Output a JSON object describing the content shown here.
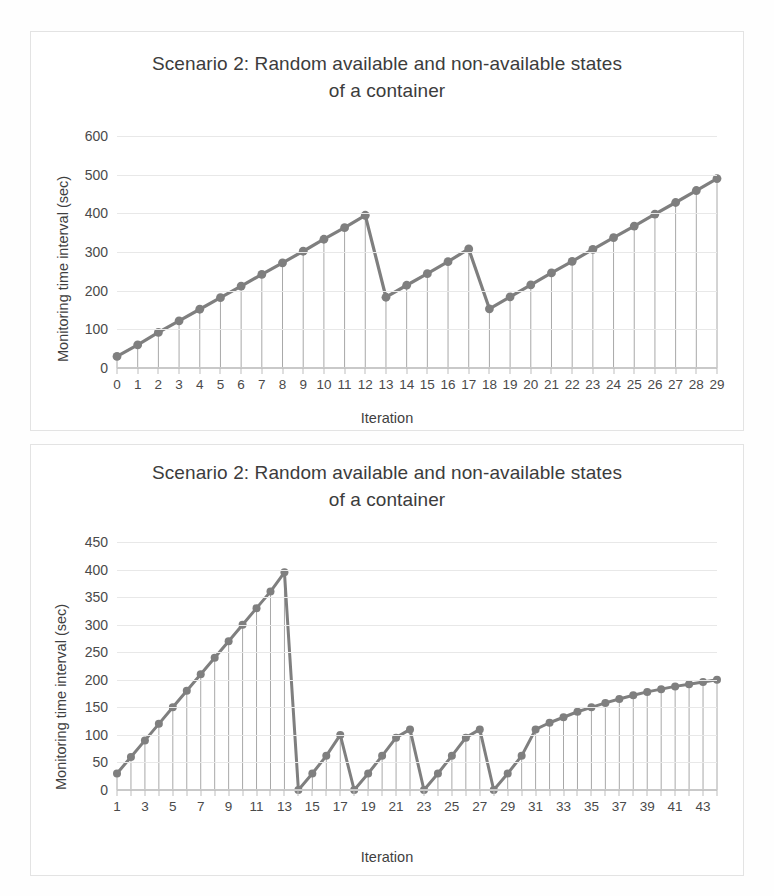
{
  "page": {
    "background": "#fefefe",
    "series_color": "#7f7f7f",
    "grid_color": "#e8e8e8"
  },
  "charts": [
    {
      "id": "chart-1",
      "title_line1": "Scenario 2: Random available and non-available states",
      "title_line2": "of a container",
      "ylabel": "Monitoring time interval (sec)",
      "xlabel": "Iteration"
    },
    {
      "id": "chart-2",
      "title_line1": "Scenario 2: Random available and non-available states",
      "title_line2": "of a container",
      "ylabel": "Monitoring time interval (sec)",
      "xlabel": "Iteration"
    }
  ],
  "chart_data": [
    {
      "type": "line",
      "title": "Scenario 2: Random available and non-available states of a container",
      "xlabel": "Iteration",
      "ylabel": "Monitoring time interval (sec)",
      "ylim": [
        0,
        600
      ],
      "yticks": [
        0,
        100,
        200,
        300,
        400,
        500,
        600
      ],
      "xlim": [
        0,
        29
      ],
      "xticks": [
        0,
        1,
        2,
        3,
        4,
        5,
        6,
        7,
        8,
        9,
        10,
        11,
        12,
        13,
        14,
        15,
        16,
        17,
        18,
        19,
        20,
        21,
        22,
        23,
        24,
        25,
        26,
        27,
        28,
        29
      ],
      "xtick_labels": [
        "0",
        "1",
        "2",
        "3",
        "4",
        "5",
        "6",
        "7",
        "8",
        "9",
        "10",
        "11",
        "12",
        "13",
        "14",
        "15",
        "16",
        "17",
        "18",
        "19",
        "20",
        "21",
        "22",
        "23",
        "24",
        "25",
        "26",
        "27",
        "28",
        "29"
      ],
      "grid": true,
      "legend": false,
      "markers": true,
      "drop_lines": true,
      "x": [
        0,
        1,
        2,
        3,
        4,
        5,
        6,
        7,
        8,
        9,
        10,
        11,
        12,
        13,
        14,
        15,
        16,
        17,
        18,
        19,
        20,
        21,
        22,
        23,
        24,
        25,
        26,
        27,
        28,
        29
      ],
      "values": [
        30,
        60,
        92,
        122,
        152,
        182,
        212,
        242,
        272,
        302,
        333,
        363,
        395,
        183,
        214,
        244,
        275,
        308,
        153,
        184,
        215,
        246,
        276,
        307,
        337,
        367,
        398,
        428,
        459,
        490
      ]
    },
    {
      "type": "line",
      "title": "Scenario 2: Random available and non-available states of a container",
      "xlabel": "Iteration",
      "ylabel": "Monitoring time interval (sec)",
      "ylim": [
        0,
        450
      ],
      "yticks": [
        0,
        50,
        100,
        150,
        200,
        250,
        300,
        350,
        400,
        450
      ],
      "xlim": [
        1,
        44
      ],
      "xticks": [
        1,
        3,
        5,
        7,
        9,
        11,
        13,
        15,
        17,
        19,
        21,
        23,
        25,
        27,
        29,
        31,
        33,
        35,
        37,
        39,
        41,
        43
      ],
      "xtick_labels": [
        "1",
        "3",
        "5",
        "7",
        "9",
        "11",
        "13",
        "15",
        "17",
        "19",
        "21",
        "23",
        "25",
        "27",
        "29",
        "31",
        "33",
        "35",
        "37",
        "39",
        "41",
        "43"
      ],
      "grid": true,
      "legend": false,
      "markers": true,
      "drop_lines": true,
      "x": [
        1,
        2,
        3,
        4,
        5,
        6,
        7,
        8,
        9,
        10,
        11,
        12,
        13,
        14,
        15,
        16,
        17,
        18,
        19,
        20,
        21,
        22,
        23,
        24,
        25,
        26,
        27,
        28,
        29,
        30,
        31,
        32,
        33,
        34,
        35,
        36,
        37,
        38,
        39,
        40,
        41,
        42,
        43,
        44
      ],
      "values": [
        30,
        60,
        90,
        120,
        150,
        180,
        210,
        240,
        270,
        300,
        330,
        360,
        395,
        0,
        30,
        62,
        100,
        0,
        30,
        62,
        95,
        110,
        0,
        30,
        62,
        95,
        110,
        0,
        30,
        62,
        110,
        122,
        132,
        142,
        150,
        158,
        165,
        172,
        178,
        183,
        188,
        192,
        196,
        200
      ]
    }
  ]
}
